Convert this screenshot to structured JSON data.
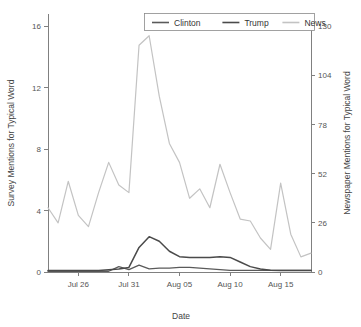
{
  "chart_data": {
    "type": "line",
    "title": "",
    "xlabel": "Date",
    "ylabel": "Survey Mentions for Typical Word",
    "y2label": "Newspaper Mentions for Typical Word",
    "ylim": [
      0,
      16.8
    ],
    "y2lim": [
      0,
      136.5
    ],
    "yticks": [
      0,
      4,
      8,
      12,
      16
    ],
    "yticklabels": [
      "0",
      "4",
      "8",
      "12",
      "16"
    ],
    "y2ticks": [
      0,
      26,
      52,
      78,
      104,
      130
    ],
    "y2ticklabels": [
      "0",
      "26",
      "52",
      "78",
      "104",
      "130"
    ],
    "xticks": [
      "Jul 26",
      "Jul 31",
      "Aug 05",
      "Aug 10",
      "Aug 15"
    ],
    "xtickindices": [
      3,
      8,
      13,
      18,
      23
    ],
    "grid": false,
    "legend_position": "top",
    "x": [
      "Jul 23",
      "Jul 24",
      "Jul 25",
      "Jul 26",
      "Jul 27",
      "Jul 28",
      "Jul 29",
      "Jul 30",
      "Jul 31",
      "Aug 01",
      "Aug 02",
      "Aug 03",
      "Aug 04",
      "Aug 05",
      "Aug 06",
      "Aug 07",
      "Aug 08",
      "Aug 09",
      "Aug 10",
      "Aug 11",
      "Aug 12",
      "Aug 13",
      "Aug 14",
      "Aug 15",
      "Aug 16",
      "Aug 17",
      "Aug 18"
    ],
    "series": [
      {
        "name": "Clinton",
        "axis": "left",
        "color": "#5a5a5a",
        "width": 1.3,
        "values": [
          0.05,
          0.05,
          0.05,
          0.05,
          0.05,
          0.05,
          0.05,
          0.35,
          0.15,
          0.45,
          0.2,
          0.25,
          0.25,
          0.3,
          0.3,
          0.25,
          0.2,
          0.15,
          0.1,
          0.1,
          0.1,
          0.1,
          0.1,
          0.1,
          0.1,
          0.1,
          0.1
        ]
      },
      {
        "name": "Trump",
        "axis": "left",
        "color": "#4a4a4a",
        "width": 1.5,
        "values": [
          0.1,
          0.1,
          0.1,
          0.1,
          0.1,
          0.1,
          0.15,
          0.2,
          0.3,
          1.6,
          2.3,
          2.0,
          1.35,
          1.0,
          0.95,
          0.95,
          0.95,
          1.0,
          0.95,
          0.65,
          0.35,
          0.2,
          0.12,
          0.1,
          0.1,
          0.1,
          0.1
        ]
      },
      {
        "name": "News",
        "axis": "right",
        "color": "#c3c3c3",
        "width": 1.2,
        "values": [
          34,
          26,
          48,
          30,
          24,
          42,
          58,
          46,
          42,
          120,
          125,
          93,
          68,
          58,
          39,
          44,
          34,
          57,
          42,
          28,
          27,
          18,
          12,
          47,
          20,
          8,
          10
        ]
      }
    ],
    "series_left_equivalent": {
      "News_left_units": [
        4.2,
        3.2,
        5.9,
        3.7,
        3.0,
        5.2,
        7.1,
        5.7,
        5.2,
        14.8,
        15.4,
        11.4,
        8.4,
        7.1,
        4.8,
        5.4,
        4.2,
        7.0,
        5.2,
        3.4,
        3.3,
        2.2,
        1.5,
        5.8,
        2.5,
        1.0,
        1.2
      ],
      "Trump_peak": 15.2,
      "Clinton_peak": 2.3
    }
  },
  "legend": {
    "items": [
      {
        "label": "Clinton",
        "color": "#5a5a5a"
      },
      {
        "label": "Trump",
        "color": "#4a4a4a"
      },
      {
        "label": "News",
        "color": "#c3c3c3"
      }
    ]
  }
}
